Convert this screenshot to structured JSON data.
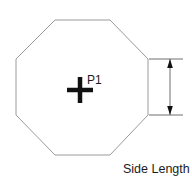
{
  "diagram": {
    "type": "octagon-side-length-annotation",
    "shape": {
      "name": "regular-octagon",
      "outline_color": "#9a9a9a",
      "fill": "none",
      "vertices": [
        [
          55,
          20
        ],
        [
          110,
          20
        ],
        [
          148,
          59
        ],
        [
          148,
          115
        ],
        [
          110,
          155
        ],
        [
          55,
          155
        ],
        [
          16,
          115
        ],
        [
          16,
          59
        ]
      ]
    },
    "center_marker": {
      "label": "P1",
      "color": "#111111",
      "center": [
        80,
        90
      ],
      "arm_length": 13
    },
    "dimension": {
      "label": "Side Length",
      "color": "#6e6e6e",
      "measures_edge": "right-vertical-side",
      "line_x": 170,
      "top_y": 59,
      "bottom_y": 115,
      "extension_from_x": 148,
      "extension_to_x": 183,
      "arrow_style": "double-ended-inward"
    }
  }
}
